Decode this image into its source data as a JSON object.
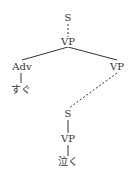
{
  "tree": {
    "root": {
      "label": "S"
    },
    "vp_top": {
      "label": "VP"
    },
    "adv": {
      "label": "Adv"
    },
    "adv_word": {
      "label": "すぐ"
    },
    "vp_right": {
      "label": "VP"
    },
    "s_embedded": {
      "label": "S"
    },
    "vp_embedded": {
      "label": "VP"
    },
    "verb_word": {
      "label": "泣く"
    }
  },
  "colors": {
    "line": "#333333",
    "text": "#333333"
  }
}
